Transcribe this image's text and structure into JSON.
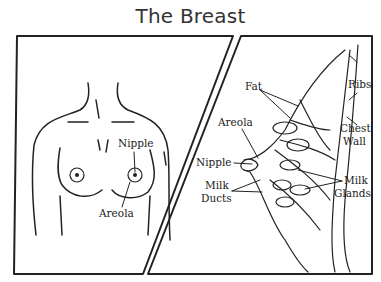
{
  "title": "The Breast",
  "front_view": {
    "labels": {
      "nipple": "Nipple",
      "areola": "Areola"
    }
  },
  "side_view": {
    "labels": {
      "fat": "Fat",
      "ribs": "Ribs",
      "areola": "Areola",
      "chest_wall_1": "Chest",
      "chest_wall_2": "Wall",
      "nipple": "Nipple",
      "milk_ducts_1": "Milk",
      "milk_ducts_2": "Ducts",
      "milk_glands_1": "Milk",
      "milk_glands_2": "Glands"
    }
  }
}
